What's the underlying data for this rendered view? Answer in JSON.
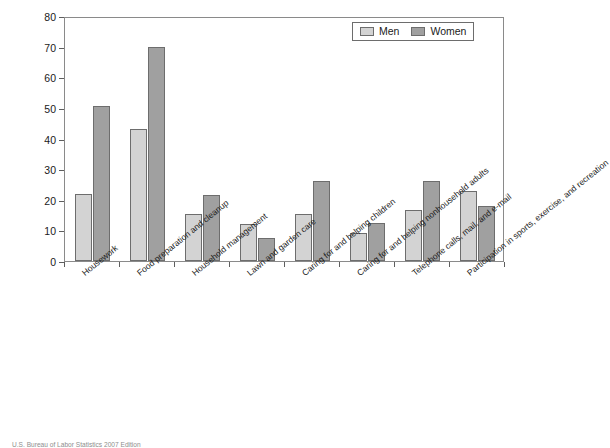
{
  "chart_data": {
    "type": "bar",
    "title": "",
    "xlabel": "",
    "ylabel": "Percentage of the population engaged in the activity per day",
    "ylabel_lines": [
      "Percentage of the population engaged in",
      "the activity per day"
    ],
    "ylim": [
      0,
      80
    ],
    "ytick_step": 10,
    "yticks": [
      0,
      10,
      20,
      30,
      40,
      50,
      60,
      70,
      80
    ],
    "grid": false,
    "legend_position": "top-right",
    "categories": [
      "Housework",
      "Food preparation and cleanup",
      "Household management",
      "Lawn and garden care",
      "Caring for and helping children",
      "Caring for and helping nonhousehold adults",
      "Telephone calls, mail, and e-mail",
      "Participation in sports, exercise, and recreation"
    ],
    "series": [
      {
        "name": "Men",
        "color": "#d3d3d3",
        "values": [
          22,
          43,
          15.5,
          12,
          15.5,
          9,
          16.5,
          23
        ]
      },
      {
        "name": "Women",
        "color": "#a0a0a0",
        "values": [
          50.5,
          70,
          21.5,
          7.5,
          26,
          12.5,
          26,
          18
        ]
      }
    ]
  },
  "legend": {
    "items": [
      {
        "label": "Men"
      },
      {
        "label": "Women"
      }
    ]
  },
  "footer": {
    "source": "U.S. Bureau of Labor Statistics 2007 Edition"
  }
}
